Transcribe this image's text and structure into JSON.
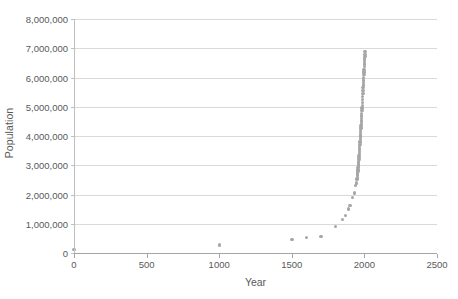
{
  "chart_data": {
    "type": "scatter",
    "title": "",
    "subtitle": "",
    "xlabel": "Year",
    "ylabel": "Population",
    "xlim": [
      0,
      2500
    ],
    "ylim": [
      0,
      8000000
    ],
    "xticks": [
      0,
      500,
      1000,
      1500,
      2000,
      2500
    ],
    "xtick_labels": [
      "0",
      "500",
      "1000",
      "1500",
      "2000",
      "2500"
    ],
    "yticks": [
      0,
      1000000,
      2000000,
      3000000,
      4000000,
      5000000,
      6000000,
      7000000,
      8000000
    ],
    "ytick_labels": [
      "0",
      "1,000,000",
      "2,000,000",
      "3,000,000",
      "4,000,000",
      "5,000,000",
      "6,000,000",
      "7,000,000",
      "8,000,000"
    ],
    "grid": "horizontal",
    "legend": "none",
    "marker": "circle",
    "marker_color": "#a6a6a6",
    "series": [
      {
        "name": "Population",
        "points": [
          [
            0,
            120000
          ],
          [
            1000,
            280000
          ],
          [
            1500,
            460000
          ],
          [
            1600,
            520000
          ],
          [
            1700,
            560000
          ],
          [
            1800,
            900000
          ],
          [
            1850,
            1150000
          ],
          [
            1870,
            1280000
          ],
          [
            1890,
            1500000
          ],
          [
            1900,
            1620000
          ],
          [
            1920,
            1900000
          ],
          [
            1930,
            2050000
          ],
          [
            1940,
            2300000
          ],
          [
            1945,
            2400000
          ],
          [
            1950,
            2530000
          ],
          [
            1951,
            2590000
          ],
          [
            1952,
            2640000
          ],
          [
            1953,
            2690000
          ],
          [
            1954,
            2740000
          ],
          [
            1955,
            2800000
          ],
          [
            1956,
            2860000
          ],
          [
            1957,
            2920000
          ],
          [
            1958,
            2980000
          ],
          [
            1959,
            3030000
          ],
          [
            1960,
            3080000
          ],
          [
            1961,
            3130000
          ],
          [
            1962,
            3200000
          ],
          [
            1963,
            3270000
          ],
          [
            1964,
            3340000
          ],
          [
            1965,
            3410000
          ],
          [
            1966,
            3480000
          ],
          [
            1967,
            3560000
          ],
          [
            1968,
            3640000
          ],
          [
            1969,
            3720000
          ],
          [
            1970,
            3800000
          ],
          [
            1971,
            3880000
          ],
          [
            1972,
            3960000
          ],
          [
            1973,
            4040000
          ],
          [
            1974,
            4120000
          ],
          [
            1975,
            4190000
          ],
          [
            1976,
            4270000
          ],
          [
            1977,
            4350000
          ],
          [
            1978,
            4420000
          ],
          [
            1979,
            4510000
          ],
          [
            1980,
            4590000
          ],
          [
            1981,
            4680000
          ],
          [
            1982,
            4770000
          ],
          [
            1983,
            4870000
          ],
          [
            1984,
            4960000
          ],
          [
            1985,
            5050000
          ],
          [
            1986,
            5150000
          ],
          [
            1987,
            5250000
          ],
          [
            1988,
            5350000
          ],
          [
            1989,
            5450000
          ],
          [
            1990,
            5550000
          ],
          [
            1991,
            5650000
          ],
          [
            1992,
            5740000
          ],
          [
            1993,
            5830000
          ],
          [
            1994,
            5920000
          ],
          [
            1995,
            6010000
          ],
          [
            1996,
            6100000
          ],
          [
            1997,
            6190000
          ],
          [
            1998,
            6280000
          ],
          [
            1999,
            6370000
          ],
          [
            2000,
            6460000
          ],
          [
            2001,
            6540000
          ],
          [
            2002,
            6630000
          ],
          [
            2003,
            6710000
          ],
          [
            2004,
            6790000
          ],
          [
            2005,
            6880000
          ]
        ]
      }
    ]
  }
}
